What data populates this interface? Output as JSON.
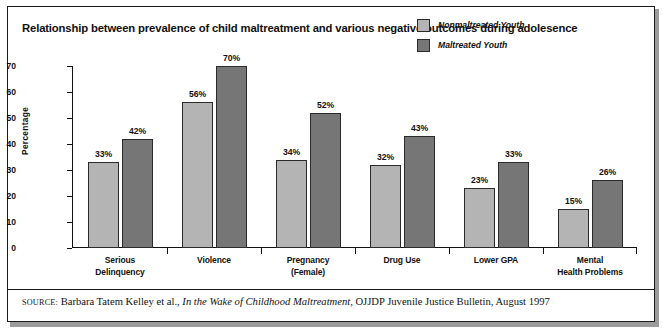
{
  "title": "Relationship between prevalence of child maltreatment and various negative outcomes during adolesence",
  "legend": {
    "items": [
      {
        "label": "Nonmaltreated Youth",
        "color": "#b4b4b4"
      },
      {
        "label": "Maltreated Youth",
        "color": "#767676"
      }
    ]
  },
  "source": {
    "prefix": "SOURCE:",
    "authors": " Barbara Tatem Kelley et al., ",
    "work": "In the Wake of Childhood Maltreatment",
    "publication": ", OJJDP Juvenile Justice Bulletin, August 1997"
  },
  "chart_data": {
    "type": "bar",
    "title": "Relationship between prevalence of child maltreatment and various negative outcomes during adolesence",
    "xlabel": "",
    "ylabel": "Percentage",
    "ylim": [
      0,
      70
    ],
    "yticks": [
      0,
      10,
      20,
      30,
      40,
      50,
      60,
      70
    ],
    "ytick_labels": [
      "0",
      "10",
      "20",
      "30",
      "40",
      "50",
      "60",
      "70"
    ],
    "grid": false,
    "legend_position": "top-right",
    "categories": [
      "Serious\nDelinquency",
      "Violence",
      "Pregnancy\n(Female)",
      "Drug Use",
      "Lower GPA",
      "Mental\nHealth Problems"
    ],
    "category_lines": [
      [
        "Serious",
        "Delinquency"
      ],
      [
        "Violence",
        ""
      ],
      [
        "Pregnancy",
        "(Female)"
      ],
      [
        "Drug Use",
        ""
      ],
      [
        "Lower GPA",
        ""
      ],
      [
        "Mental",
        "Health Problems"
      ]
    ],
    "series": [
      {
        "name": "Nonmaltreated Youth",
        "color": "#b4b4b4",
        "values": [
          33,
          56,
          34,
          32,
          23,
          15
        ],
        "labels": [
          "33%",
          "56%",
          "34%",
          "32%",
          "23%",
          "15%"
        ]
      },
      {
        "name": "Maltreated Youth",
        "color": "#767676",
        "values": [
          42,
          70,
          52,
          43,
          33,
          26
        ],
        "labels": [
          "42%",
          "70%",
          "52%",
          "43%",
          "33%",
          "26%"
        ]
      }
    ]
  }
}
